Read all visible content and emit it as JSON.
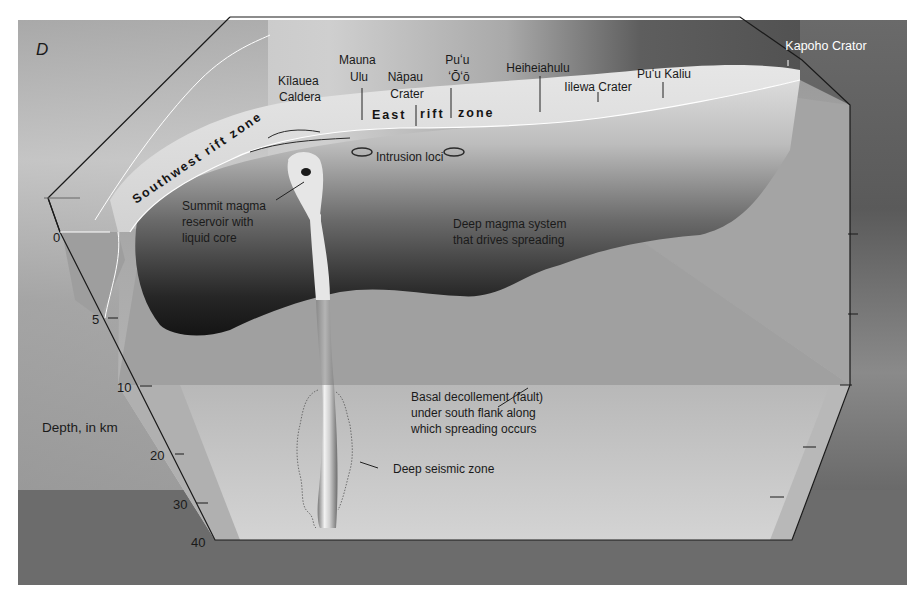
{
  "figure": {
    "panel_letter": "D",
    "background_colors": {
      "terrain_light": "#c9c9c9",
      "terrain_dark": "#5a5a5a",
      "ocean_band": "#6e6e6e",
      "block_face": "#a8a8a8",
      "decollement_plane": "#c4c4c4",
      "magma_dark": "#1e1e1e"
    }
  },
  "surface_labels": {
    "kilauea_caldera": [
      "Kīlauea",
      "Caldera"
    ],
    "mauna_ulu": [
      "Mauna",
      "Ulu"
    ],
    "napau_crater": [
      "Nāpau",
      "Crater"
    ],
    "puu_oo": [
      "Puʻu",
      "ʻŌʻō"
    ],
    "heiheiahulu": "Heiheiahulu",
    "iilewa_crater": "Iilewa Crater",
    "puu_kaliu": "Puʻu Kaliu",
    "kapoho_crater": "Kapoho Crator"
  },
  "rift_zones": {
    "southwest": "Southwest rift zone",
    "east": [
      "East",
      "rift",
      "zone"
    ]
  },
  "annotations": {
    "intrusion_loci": "Intrusion loci",
    "summit_reservoir": [
      "Summit magma",
      "reservoir with",
      "liquid core"
    ],
    "deep_magma": [
      "Deep magma system",
      "that drives spreading"
    ],
    "decollement": [
      "Basal decollement (fault)",
      "under south flank along",
      "which spreading occurs"
    ],
    "deep_seismic": "Deep seismic zone"
  },
  "depth_axis": {
    "label": "Depth, in km",
    "ticks": [
      "0",
      "5",
      "10",
      "20",
      "30",
      "40"
    ]
  }
}
